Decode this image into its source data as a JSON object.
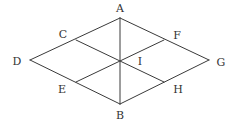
{
  "diagram": {
    "type": "geometry",
    "points": {
      "A": {
        "label": "A",
        "x": 120,
        "y": 18,
        "lx": 120,
        "ly": 12
      },
      "B": {
        "label": "B",
        "x": 120,
        "y": 104,
        "lx": 120,
        "ly": 119
      },
      "D": {
        "label": "D",
        "x": 30,
        "y": 60,
        "lx": 17,
        "ly": 65
      },
      "G": {
        "label": "G",
        "x": 209,
        "y": 60,
        "lx": 221,
        "ly": 66
      },
      "C": {
        "label": "C",
        "x": 76,
        "y": 40,
        "lx": 63,
        "ly": 38
      },
      "F": {
        "label": "F",
        "x": 164,
        "y": 40,
        "lx": 177,
        "ly": 39
      },
      "E": {
        "label": "E",
        "x": 76,
        "y": 82,
        "lx": 62,
        "ly": 93
      },
      "H": {
        "label": "H",
        "x": 164,
        "y": 82,
        "lx": 178,
        "ly": 93
      },
      "I": {
        "label": "I",
        "x": 120,
        "y": 61,
        "lx": 140,
        "ly": 65
      }
    },
    "segments": [
      [
        "A",
        "D"
      ],
      [
        "D",
        "B"
      ],
      [
        "B",
        "G"
      ],
      [
        "G",
        "A"
      ],
      [
        "A",
        "B"
      ],
      [
        "C",
        "H"
      ],
      [
        "F",
        "E"
      ]
    ],
    "colors": {
      "line": "#3a3a3a",
      "label": "#333333",
      "background": "#ffffff"
    }
  }
}
